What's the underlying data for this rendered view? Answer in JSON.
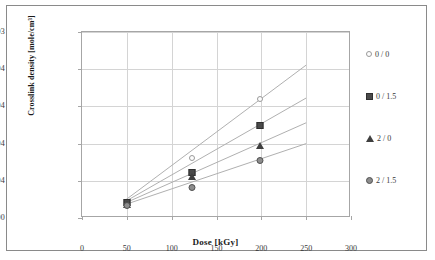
{
  "chart_data": {
    "type": "scatter",
    "title": "",
    "xlabel": "Dose [kGy]",
    "ylabel": "Crosslink density [mole/cm³]",
    "xlim": [
      0,
      300
    ],
    "ylim": [
      0,
      0.001
    ],
    "grid": true,
    "legend_position": "right",
    "xticks": [
      "0",
      "50",
      "100",
      "150",
      "200",
      "250",
      "300"
    ],
    "xtick_values": [
      0,
      50,
      100,
      150,
      200,
      250,
      300
    ],
    "yticks": [
      "0.E+00",
      "2.E-04",
      "4.E-04",
      "6.E-04",
      "8.E-04",
      "1.E-03"
    ],
    "ytick_values": [
      0,
      0.0002,
      0.0004,
      0.0006,
      0.0008,
      0.001
    ],
    "series": [
      {
        "name": "0 / 0",
        "marker": "circle-open",
        "points": [
          {
            "x": 50,
            "y": 9.8e-05
          },
          {
            "x": 123,
            "y": 0.000335
          },
          {
            "x": 198,
            "y": 0.000652
          }
        ],
        "trendline": {
          "x_start": 48,
          "y_start": 9.5e-05,
          "x_end": 250,
          "y_end": 0.000822
        }
      },
      {
        "name": "0 / 1.5",
        "marker": "square-filled",
        "points": [
          {
            "x": 50,
            "y": 9.2e-05
          },
          {
            "x": 123,
            "y": 0.000252
          },
          {
            "x": 198,
            "y": 0.000508
          }
        ],
        "trendline": {
          "x_start": 48,
          "y_start": 8.8e-05,
          "x_end": 250,
          "y_end": 0.000645
        }
      },
      {
        "name": "2 / 0",
        "marker": "triangle-filled",
        "points": [
          {
            "x": 50,
            "y": 8.2e-05
          },
          {
            "x": 123,
            "y": 0.000232
          },
          {
            "x": 198,
            "y": 0.000397
          }
        ],
        "trendline": {
          "x_start": 48,
          "y_start": 8e-05,
          "x_end": 250,
          "y_end": 0.000512
        }
      },
      {
        "name": "2 / 1.5",
        "marker": "circle-ring",
        "points": [
          {
            "x": 50,
            "y": 7.3e-05
          },
          {
            "x": 123,
            "y": 0.000172
          },
          {
            "x": 198,
            "y": 0.000315
          }
        ],
        "trendline": {
          "x_start": 48,
          "y_start": 7.2e-05,
          "x_end": 250,
          "y_end": 0.0004
        }
      }
    ]
  },
  "legend": {
    "items": [
      {
        "label": "0 / 0",
        "marker": "circle-open"
      },
      {
        "label": "0 / 1.5",
        "marker": "square-filled"
      },
      {
        "label": "2 / 0",
        "marker": "triangle-filled"
      },
      {
        "label": "2 / 1.5",
        "marker": "circle-ring"
      }
    ]
  },
  "colors": {
    "grid": "#d4d4d4",
    "axis": "#a6a6a6",
    "frame": "#8a8a8a",
    "text": "#3a3a3a",
    "title_text": "#1a1a1a",
    "trendline": "#b0b0b0",
    "marker_dark": "#4a4a4a",
    "marker_light": "#fdfdfd"
  }
}
